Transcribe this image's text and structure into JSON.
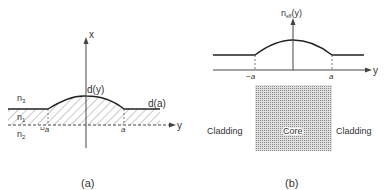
{
  "panel_a": {
    "caption": "(a)",
    "axis_x_label": "x",
    "axis_y_label": "y",
    "curve_label": "d(y)",
    "edge_label": "d(a)",
    "region_labels": [
      "n3",
      "n1",
      "n2"
    ],
    "region_label_display": {
      "n3": "n",
      "n3_sub": "3",
      "n1": "n",
      "n1_sub": "1",
      "n2": "n",
      "n2_sub": "2"
    },
    "tick_left": "−a",
    "tick_right": "a"
  },
  "panel_b": {
    "caption": "(b)",
    "axis_label": "n",
    "axis_label_sub": "eff",
    "axis_label_suffix": "(y)",
    "axis_y_label": "y",
    "tick_left": "−a",
    "tick_right": "a",
    "core_label": "Core",
    "cladding_left_label": "Cladding",
    "cladding_right_label": "Cladding",
    "colors": {
      "core_fill": "#c8c8c8",
      "line": "#222222"
    }
  }
}
